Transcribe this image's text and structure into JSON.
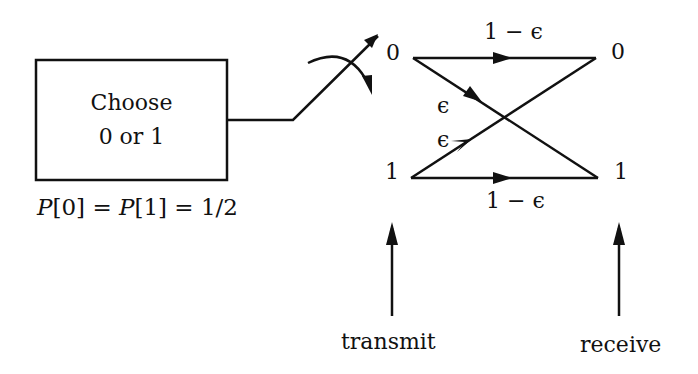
{
  "diagram": {
    "type": "binary-symmetric-channel",
    "source_box": {
      "line1": "Choose",
      "line2": "0 or 1"
    },
    "prior": {
      "text_P0": "P",
      "text_0": "[0]",
      "text_eq1": " = ",
      "text_P1": "P",
      "text_1": "[1]",
      "text_eq2": " = 1/2"
    },
    "transmit_nodes": {
      "zero": "0",
      "one": "1"
    },
    "receive_nodes": {
      "zero": "0",
      "one": "1"
    },
    "edges": {
      "top_label": "1 − ϵ",
      "bottom_label": "1 − ϵ",
      "cross_down_label": "ϵ",
      "cross_up_label": "ϵ"
    },
    "bottom_labels": {
      "transmit": "transmit",
      "receive": "receive"
    },
    "stroke_color": "#111111",
    "background": "#ffffff"
  }
}
